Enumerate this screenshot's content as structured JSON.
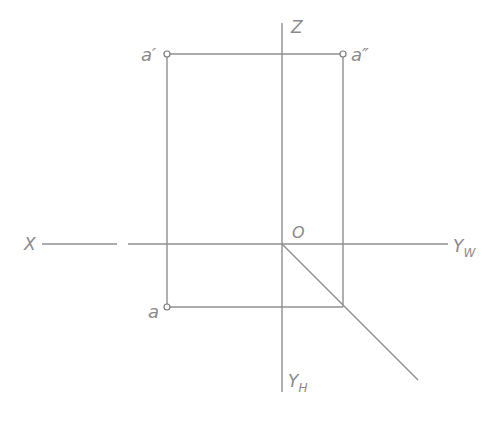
{
  "diagram": {
    "type": "orthographic-projection-of-point",
    "colors": {
      "line": "#8f8f8f",
      "label": "#8a8a8a",
      "background": "#ffffff"
    },
    "origin": {
      "label": "O",
      "x": 282,
      "y": 244
    },
    "axes": {
      "z": {
        "label": "Z",
        "sub": ""
      },
      "x": {
        "label": "X",
        "sub": ""
      },
      "yw": {
        "label": "Y",
        "sub": "W"
      },
      "yh": {
        "label": "Y",
        "sub": "H"
      }
    },
    "points": {
      "a_front": {
        "label": "a′",
        "x": 167,
        "y": 54
      },
      "a_side": {
        "label": "a″",
        "x": 343,
        "y": 54
      },
      "a_top": {
        "label": "a",
        "x": 167,
        "y": 307
      }
    }
  }
}
